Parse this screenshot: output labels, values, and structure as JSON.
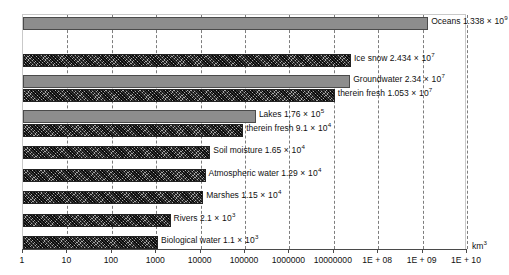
{
  "chart_data": {
    "type": "bar",
    "orientation": "horizontal",
    "title": "",
    "xlabel": "km3",
    "ylabel": "",
    "xscale": "log",
    "xlim": [
      1,
      10000000000
    ],
    "grid": true,
    "legend": "none",
    "categories": [
      "Oceans",
      "Ice snow",
      "Groundwater",
      "therein fresh",
      "Lakes",
      "therein fresh",
      "Soil moisture",
      "Atmospheric water",
      "Marshes",
      "Rivers",
      "Biological water"
    ],
    "values": [
      1338000000,
      24340000,
      23400000,
      10530000,
      176000,
      91000,
      16500,
      12900,
      11500,
      2100,
      1100
    ],
    "value_text": [
      "1.338 × 10⁹",
      "2.434 × 10⁷",
      "2.34 × 10⁷",
      "1.053 × 10⁷",
      "1.76 × 10⁵",
      "9.1 × 10⁴",
      "1.65 × 10⁴",
      "1.29 × 10⁴",
      "1.15 × 10⁴",
      "2.1 × 10³",
      "1.1 × 10³"
    ],
    "tick_labels": [
      "1",
      "10",
      "100",
      "1000",
      "10000",
      "100000",
      "1000000",
      "10000000",
      "1E + 08",
      "1E + 09",
      "1E + 10"
    ],
    "tick_values": [
      1,
      10,
      100,
      1000,
      10000,
      100000,
      1000000,
      10000000,
      100000000,
      1000000000,
      10000000000
    ],
    "colors": {
      "bar_solid": "#8d8d8d",
      "bar_hatch": "#3c3c3c",
      "grid": "#7d7d7d",
      "axis": "#4a4a4a",
      "plot_border": "#c9c9c9",
      "text": "#111111",
      "background": "#ffffff"
    }
  },
  "bars": [
    {
      "label": "Oceans",
      "mantissa": "1.338",
      "exp": "9",
      "style": "solid",
      "value": 1338000000,
      "top": 2
    },
    {
      "label": "Ice snow",
      "mantissa": "2.434",
      "exp": "7",
      "style": "hatch",
      "value": 24340000,
      "top": 39
    },
    {
      "label": "Groundwater",
      "mantissa": "2.34",
      "exp": "7",
      "style": "solid",
      "value": 23400000,
      "top": 60
    },
    {
      "label": "therein fresh",
      "mantissa": "1.053",
      "exp": "7",
      "style": "hatch",
      "value": 10530000,
      "top": 74
    },
    {
      "label": "Lakes",
      "mantissa": "1.76",
      "exp": "5",
      "style": "solid",
      "value": 176000,
      "top": 95
    },
    {
      "label": "therein fresh",
      "mantissa": "9.1",
      "exp": "4",
      "style": "hatch",
      "value": 91000,
      "top": 109
    },
    {
      "label": "Soil moisture",
      "mantissa": "1.65",
      "exp": "4",
      "style": "hatch",
      "value": 16500,
      "top": 131
    },
    {
      "label": "Atmospheric water",
      "mantissa": "1.29",
      "exp": "4",
      "style": "hatch",
      "value": 12900,
      "top": 154
    },
    {
      "label": "Marshes",
      "mantissa": "1.15",
      "exp": "4",
      "style": "hatch",
      "value": 11500,
      "top": 176
    },
    {
      "label": "Rivers",
      "mantissa": "2.1",
      "exp": "3",
      "style": "hatch",
      "value": 2100,
      "top": 199
    },
    {
      "label": "Biological water",
      "mantissa": "1.1",
      "exp": "3",
      "style": "hatch",
      "value": 1100,
      "top": 221
    }
  ],
  "axis": {
    "unit_base": "km",
    "unit_exp": "3"
  }
}
